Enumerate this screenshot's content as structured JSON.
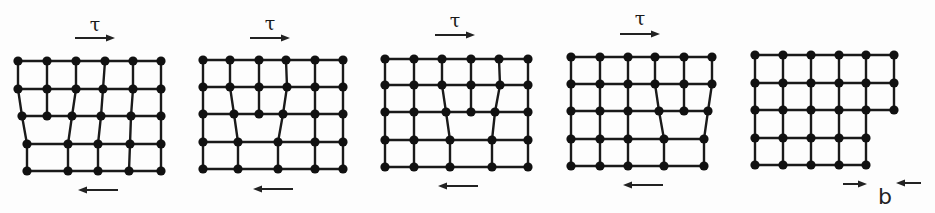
{
  "figure": {
    "description": "Edge dislocation glide through a crystal lattice under shear stress, producing a surface step of one Burgers vector",
    "stress_symbol": "τ",
    "burgers_label": "b",
    "colors": {
      "line": "#1a1a1a",
      "node": "#111111",
      "background": "#fdfdfd"
    }
  },
  "panels": [
    {
      "id": "panel-1",
      "stage": "dislocation enters at left",
      "tau_label": "τ",
      "top_arrow": {
        "x1": 75,
        "x2": 115,
        "y": 38,
        "dir": "right"
      },
      "tau_pos": {
        "x": 95,
        "y": 31
      },
      "bottom_arrow": {
        "x1": 118,
        "x2": 78,
        "y": 190,
        "dir": "left"
      },
      "rows": [
        {
          "y": 61,
          "xs": [
            18,
            47,
            76,
            105,
            133,
            161
          ]
        },
        {
          "y": 89,
          "xs": [
            18,
            47,
            76,
            103,
            133,
            161
          ]
        },
        {
          "y": 116,
          "xs": [
            22,
            47,
            72,
            101,
            131,
            161
          ]
        },
        {
          "y": 144,
          "xs": [
            27,
            68,
            98,
            130,
            161
          ]
        },
        {
          "y": 171,
          "xs": [
            27,
            68,
            98,
            129,
            161
          ]
        }
      ],
      "columns": [
        [
          [
            0,
            0
          ],
          [
            1,
            0
          ],
          [
            2,
            0
          ],
          [
            3,
            0
          ],
          [
            4,
            0
          ]
        ],
        [
          [
            0,
            1
          ],
          [
            1,
            1
          ],
          [
            2,
            1
          ]
        ],
        [
          [
            0,
            2
          ],
          [
            1,
            2
          ],
          [
            2,
            2
          ],
          [
            3,
            1
          ],
          [
            4,
            1
          ]
        ],
        [
          [
            0,
            3
          ],
          [
            1,
            3
          ],
          [
            2,
            3
          ],
          [
            3,
            2
          ],
          [
            4,
            2
          ]
        ],
        [
          [
            0,
            4
          ],
          [
            1,
            4
          ],
          [
            2,
            4
          ],
          [
            3,
            3
          ],
          [
            4,
            3
          ]
        ],
        [
          [
            0,
            5
          ],
          [
            1,
            5
          ],
          [
            2,
            5
          ],
          [
            3,
            4
          ],
          [
            4,
            4
          ]
        ]
      ]
    },
    {
      "id": "panel-2",
      "stage": "dislocation glides right",
      "tau_label": "τ",
      "top_arrow": {
        "x1": 250,
        "x2": 290,
        "y": 38,
        "dir": "right"
      },
      "tau_pos": {
        "x": 270,
        "y": 30
      },
      "bottom_arrow": {
        "x1": 293,
        "x2": 253,
        "y": 189,
        "dir": "left"
      },
      "rows": [
        {
          "y": 60,
          "xs": [
            203,
            230,
            259,
            286,
            315,
            343
          ]
        },
        {
          "y": 87,
          "xs": [
            203,
            230,
            259,
            287,
            315,
            343
          ]
        },
        {
          "y": 114,
          "xs": [
            203,
            234,
            259,
            283,
            315,
            343
          ]
        },
        {
          "y": 142,
          "xs": [
            203,
            238,
            278,
            315,
            343
          ]
        },
        {
          "y": 169,
          "xs": [
            203,
            238,
            278,
            315,
            343
          ]
        }
      ],
      "columns": [
        [
          [
            0,
            0
          ],
          [
            1,
            0
          ],
          [
            2,
            0
          ],
          [
            3,
            0
          ],
          [
            4,
            0
          ]
        ],
        [
          [
            0,
            1
          ],
          [
            1,
            1
          ],
          [
            2,
            1
          ],
          [
            3,
            1
          ],
          [
            4,
            1
          ]
        ],
        [
          [
            0,
            2
          ],
          [
            1,
            2
          ],
          [
            2,
            2
          ]
        ],
        [
          [
            0,
            3
          ],
          [
            1,
            3
          ],
          [
            2,
            3
          ],
          [
            3,
            2
          ],
          [
            4,
            2
          ]
        ],
        [
          [
            0,
            4
          ],
          [
            1,
            4
          ],
          [
            2,
            4
          ],
          [
            3,
            3
          ],
          [
            4,
            3
          ]
        ],
        [
          [
            0,
            5
          ],
          [
            1,
            5
          ],
          [
            2,
            5
          ],
          [
            3,
            4
          ],
          [
            4,
            4
          ]
        ]
      ]
    },
    {
      "id": "panel-3",
      "stage": "dislocation continues gliding",
      "tau_label": "τ",
      "top_arrow": {
        "x1": 435,
        "x2": 475,
        "y": 35,
        "dir": "right"
      },
      "tau_pos": {
        "x": 455,
        "y": 27
      },
      "bottom_arrow": {
        "x1": 478,
        "x2": 438,
        "y": 186,
        "dir": "left"
      },
      "rows": [
        {
          "y": 59,
          "xs": [
            385,
            414,
            442,
            471,
            499,
            528
          ]
        },
        {
          "y": 85,
          "xs": [
            385,
            414,
            442,
            471,
            500,
            528
          ]
        },
        {
          "y": 112,
          "xs": [
            385,
            414,
            446,
            471,
            495,
            528
          ]
        },
        {
          "y": 140,
          "xs": [
            385,
            414,
            450,
            492,
            528
          ]
        },
        {
          "y": 167,
          "xs": [
            385,
            414,
            450,
            492,
            528
          ]
        }
      ],
      "columns": [
        [
          [
            0,
            0
          ],
          [
            1,
            0
          ],
          [
            2,
            0
          ],
          [
            3,
            0
          ],
          [
            4,
            0
          ]
        ],
        [
          [
            0,
            1
          ],
          [
            1,
            1
          ],
          [
            2,
            1
          ],
          [
            3,
            1
          ],
          [
            4,
            1
          ]
        ],
        [
          [
            0,
            2
          ],
          [
            1,
            2
          ],
          [
            2,
            2
          ],
          [
            3,
            2
          ],
          [
            4,
            2
          ]
        ],
        [
          [
            0,
            3
          ],
          [
            1,
            3
          ],
          [
            2,
            3
          ]
        ],
        [
          [
            0,
            4
          ],
          [
            1,
            4
          ],
          [
            2,
            4
          ],
          [
            3,
            3
          ],
          [
            4,
            3
          ]
        ],
        [
          [
            0,
            5
          ],
          [
            1,
            5
          ],
          [
            2,
            5
          ],
          [
            3,
            4
          ],
          [
            4,
            4
          ]
        ]
      ]
    },
    {
      "id": "panel-4",
      "stage": "dislocation approaches right surface",
      "tau_label": "τ",
      "top_arrow": {
        "x1": 620,
        "x2": 660,
        "y": 34,
        "dir": "right"
      },
      "tau_pos": {
        "x": 640,
        "y": 25
      },
      "bottom_arrow": {
        "x1": 663,
        "x2": 623,
        "y": 185,
        "dir": "left"
      },
      "rows": [
        {
          "y": 57,
          "xs": [
            571,
            600,
            628,
            655,
            684,
            712
          ]
        },
        {
          "y": 84,
          "xs": [
            571,
            600,
            628,
            655,
            684,
            712
          ]
        },
        {
          "y": 111,
          "xs": [
            571,
            600,
            628,
            659,
            684,
            708
          ]
        },
        {
          "y": 139,
          "xs": [
            571,
            600,
            628,
            664,
            704
          ]
        },
        {
          "y": 166,
          "xs": [
            571,
            600,
            628,
            664,
            704
          ]
        }
      ],
      "columns": [
        [
          [
            0,
            0
          ],
          [
            1,
            0
          ],
          [
            2,
            0
          ],
          [
            3,
            0
          ],
          [
            4,
            0
          ]
        ],
        [
          [
            0,
            1
          ],
          [
            1,
            1
          ],
          [
            2,
            1
          ],
          [
            3,
            1
          ],
          [
            4,
            1
          ]
        ],
        [
          [
            0,
            2
          ],
          [
            1,
            2
          ],
          [
            2,
            2
          ],
          [
            3,
            2
          ],
          [
            4,
            2
          ]
        ],
        [
          [
            0,
            3
          ],
          [
            1,
            3
          ],
          [
            2,
            3
          ],
          [
            3,
            3
          ],
          [
            4,
            3
          ]
        ],
        [
          [
            0,
            4
          ],
          [
            1,
            4
          ],
          [
            2,
            4
          ]
        ],
        [
          [
            0,
            5
          ],
          [
            1,
            5
          ],
          [
            2,
            5
          ],
          [
            3,
            4
          ],
          [
            4,
            4
          ]
        ]
      ]
    },
    {
      "id": "panel-5",
      "stage": "dislocation exits, leaving step of size b",
      "rows": [
        {
          "y": 55,
          "xs": [
            755,
            783,
            811,
            839,
            866,
            894
          ]
        },
        {
          "y": 83,
          "xs": [
            755,
            783,
            811,
            839,
            866,
            894
          ]
        },
        {
          "y": 110,
          "xs": [
            755,
            783,
            811,
            839,
            866,
            894
          ]
        },
        {
          "y": 138,
          "xs": [
            755,
            783,
            811,
            839,
            866
          ]
        },
        {
          "y": 165,
          "xs": [
            755,
            783,
            811,
            839,
            866
          ]
        }
      ],
      "columns": [
        [
          [
            0,
            0
          ],
          [
            1,
            0
          ],
          [
            2,
            0
          ],
          [
            3,
            0
          ],
          [
            4,
            0
          ]
        ],
        [
          [
            0,
            1
          ],
          [
            1,
            1
          ],
          [
            2,
            1
          ],
          [
            3,
            1
          ],
          [
            4,
            1
          ]
        ],
        [
          [
            0,
            2
          ],
          [
            1,
            2
          ],
          [
            2,
            2
          ],
          [
            3,
            2
          ],
          [
            4,
            2
          ]
        ],
        [
          [
            0,
            3
          ],
          [
            1,
            3
          ],
          [
            2,
            3
          ],
          [
            3,
            3
          ],
          [
            4,
            3
          ]
        ],
        [
          [
            0,
            4
          ],
          [
            1,
            4
          ],
          [
            2,
            4
          ],
          [
            3,
            4
          ],
          [
            4,
            4
          ]
        ],
        [
          [
            0,
            5
          ],
          [
            1,
            5
          ],
          [
            2,
            5
          ]
        ]
      ],
      "step_marker": {
        "label": "b",
        "label_pos": {
          "x": 878,
          "y": 204
        },
        "left_arrow": {
          "x1": 843,
          "x2": 867,
          "y": 184,
          "dir": "right"
        },
        "right_arrow": {
          "x1": 921,
          "x2": 896,
          "y": 183,
          "dir": "left"
        }
      }
    }
  ]
}
